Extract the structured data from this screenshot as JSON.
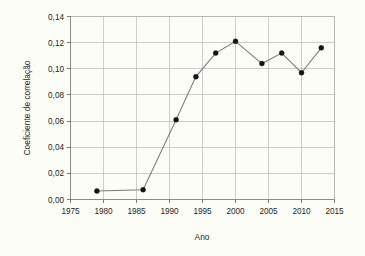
{
  "chart_data": {
    "type": "line",
    "title": "",
    "subtitle": "",
    "xlabel": "Ano",
    "ylabel": "Coeficiente de correlação",
    "xlim": [
      1975,
      2015
    ],
    "ylim": [
      0.0,
      0.14
    ],
    "xticks": [
      "1975",
      "1980",
      "1985",
      "1990",
      "1995",
      "2000",
      "2005",
      "2010",
      "2015"
    ],
    "xtick_values": [
      1975,
      1980,
      1985,
      1990,
      1995,
      2000,
      2005,
      2010,
      2015
    ],
    "yticks": [
      "0,00",
      "0,02",
      "0,04",
      "0,06",
      "0,08",
      "0,10",
      "0,12",
      "0,14"
    ],
    "ytick_values": [
      0.0,
      0.02,
      0.04,
      0.06,
      0.08,
      0.1,
      0.12,
      0.14
    ],
    "decimal_separator": ",",
    "grid": true,
    "grid_axes": "both",
    "legend": false,
    "legend_position": "none",
    "marker": "filled-circle",
    "x": [
      1979,
      1986,
      1991,
      1994,
      1997,
      2000,
      2004,
      2007,
      2010,
      2013
    ],
    "values": [
      0.0065,
      0.0075,
      0.061,
      0.094,
      0.112,
      0.121,
      0.104,
      0.112,
      0.097,
      0.116
    ],
    "points": [
      {
        "x": 1979,
        "y": 0.0065
      },
      {
        "x": 1986,
        "y": 0.0075
      },
      {
        "x": 1991,
        "y": 0.061
      },
      {
        "x": 1994,
        "y": 0.094
      },
      {
        "x": 1997,
        "y": 0.112
      },
      {
        "x": 2000,
        "y": 0.121
      },
      {
        "x": 2004,
        "y": 0.104
      },
      {
        "x": 2007,
        "y": 0.112
      },
      {
        "x": 2010,
        "y": 0.097
      },
      {
        "x": 2013,
        "y": 0.116
      }
    ],
    "series": [
      {
        "name": "Coeficiente de correlação",
        "x": [
          1979,
          1986,
          1991,
          1994,
          1997,
          2000,
          2004,
          2007,
          2010,
          2013
        ],
        "values": [
          0.0065,
          0.0075,
          0.061,
          0.094,
          0.112,
          0.121,
          0.104,
          0.112,
          0.097,
          0.116
        ]
      }
    ],
    "colors": {
      "line": "#7a7a78",
      "marker": "#151515",
      "grid": "#b9b9b4",
      "axis": "#8d8d88",
      "background": "#fdfdf8",
      "text": "#1d1d1d"
    }
  }
}
